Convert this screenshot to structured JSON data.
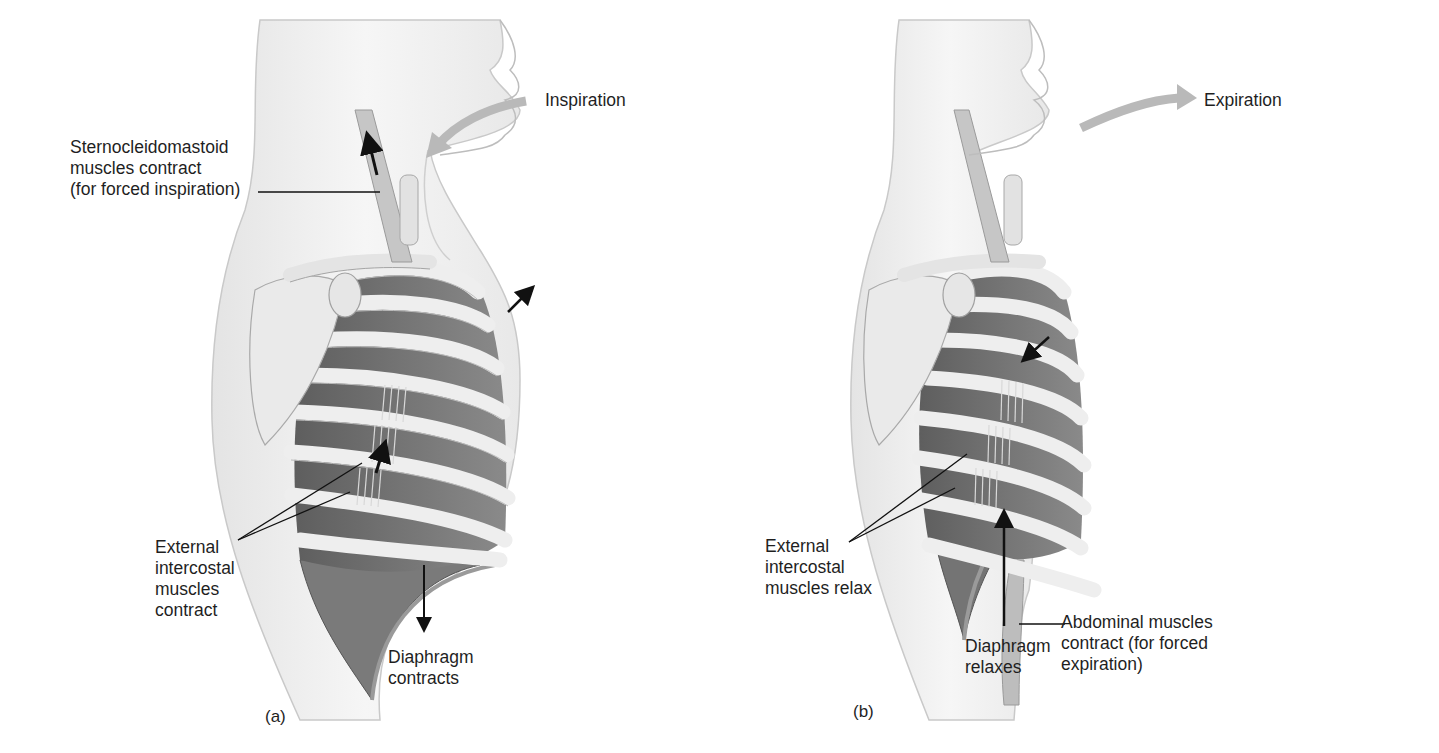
{
  "figure": {
    "panels": [
      {
        "id": "a",
        "letter": "(a)",
        "phase": "Inspiration",
        "labels": {
          "airflow": "Inspiration",
          "sternocleidomastoid": "Sternocleidomastoid\nmuscles contract\n(for forced inspiration)",
          "intercostal": "External\nintercostal\nmuscles\ncontract",
          "diaphragm": "Diaphragm\ncontracts"
        },
        "arrows": [
          "sternocleidomastoid-up",
          "chest-wall-out",
          "ribs-up",
          "diaphragm-down",
          "air-in"
        ]
      },
      {
        "id": "b",
        "letter": "(b)",
        "phase": "Expiration",
        "labels": {
          "airflow": "Expiration",
          "intercostal": "External\nintercostal\nmuscles relax",
          "diaphragm": "Diaphragm\nrelaxes",
          "abdominal": "Abdominal muscles\ncontract (for forced\nexpiration)"
        },
        "arrows": [
          "chest-wall-in",
          "diaphragm-up",
          "air-out"
        ]
      }
    ],
    "colors": {
      "skin": "#f1f1f1",
      "skin_outline": "#bdbdbd",
      "rib": "#e9e9e9",
      "intercostal_space": "#6f6f6f",
      "diaphragm": "#7b7b7b",
      "air_arrow": "#b9b9b9",
      "label_text": "#1f1f1f"
    }
  }
}
